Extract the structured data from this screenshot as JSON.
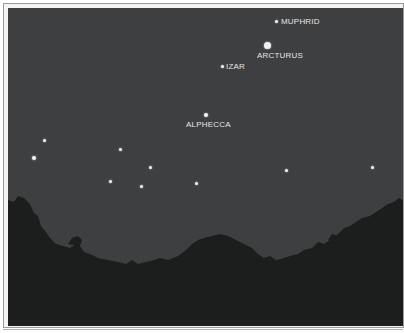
{
  "image": {
    "description": "Night sky over a tree-lined horizon showing labeled stars",
    "colors": {
      "sky": "#3d3f40",
      "trees": "#1c1d1d",
      "star": "#f2f2f2",
      "label": "#e6e6e6",
      "frame": "#9a9a9a"
    }
  },
  "stars": [
    {
      "name": "MUPHRID",
      "x": 277,
      "y": 22,
      "size": 3
    },
    {
      "name": "ARCTURUS",
      "x": 268,
      "y": 46,
      "size": 7
    },
    {
      "name": "IZAR",
      "x": 223,
      "y": 67,
      "size": 3
    },
    {
      "name": "ALPHECCA",
      "x": 206,
      "y": 115,
      "size": 4
    }
  ],
  "labels": {
    "muphrid": "MUPHRID",
    "arcturus": "ARCTURUS",
    "izar": "IZAR",
    "alphecca": "ALPHECCA"
  },
  "unlabeled_stars": [
    {
      "x": 44,
      "y": 140,
      "size": 3
    },
    {
      "x": 34,
      "y": 158,
      "size": 4
    },
    {
      "x": 120,
      "y": 149,
      "size": 3
    },
    {
      "x": 150,
      "y": 167,
      "size": 3
    },
    {
      "x": 110,
      "y": 181,
      "size": 3
    },
    {
      "x": 141,
      "y": 186,
      "size": 3
    },
    {
      "x": 196,
      "y": 183,
      "size": 3
    },
    {
      "x": 286,
      "y": 170,
      "size": 3
    },
    {
      "x": 372,
      "y": 167,
      "size": 3
    }
  ]
}
